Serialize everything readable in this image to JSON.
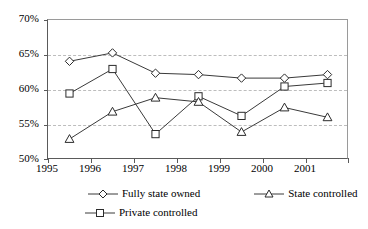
{
  "chart_data": {
    "type": "line",
    "title": "",
    "xlabel": "",
    "ylabel": "",
    "categories": [
      "1995",
      "1996",
      "1997",
      "1998",
      "1999",
      "2000",
      "2001"
    ],
    "ylim": [
      50,
      70
    ],
    "yticks": [
      50,
      55,
      60,
      65,
      70
    ],
    "ytick_labels": [
      "50%",
      "55%",
      "60%",
      "65%",
      "70%"
    ],
    "grid": "horizontal-dashed",
    "legend_position": "bottom",
    "series": [
      {
        "name": "Fully state owned",
        "marker": "diamond",
        "values": [
          64.1,
          65.3,
          62.4,
          62.2,
          61.7,
          61.7,
          62.2
        ]
      },
      {
        "name": "State controlled",
        "marker": "triangle",
        "values": [
          53.0,
          56.9,
          58.9,
          58.3,
          54.0,
          57.5,
          56.1
        ]
      },
      {
        "name": "Private controlled",
        "marker": "square",
        "values": [
          59.5,
          63.0,
          53.7,
          59.1,
          56.3,
          60.5,
          61.0
        ]
      }
    ]
  },
  "legend": {
    "items": [
      {
        "label": "Fully state owned",
        "marker": "diamond-marker-icon"
      },
      {
        "label": "State controlled",
        "marker": "triangle-marker-icon"
      },
      {
        "label": "Private controlled",
        "marker": "square-marker-icon"
      }
    ]
  },
  "colors": {
    "background": "#ffffff",
    "line": "#3a3a3a",
    "marker_stroke": "#2b2b2b",
    "marker_fill": "#ffffff",
    "grid": "#bdbdbd",
    "axis": "#5a5a5a",
    "text": "#000000"
  }
}
